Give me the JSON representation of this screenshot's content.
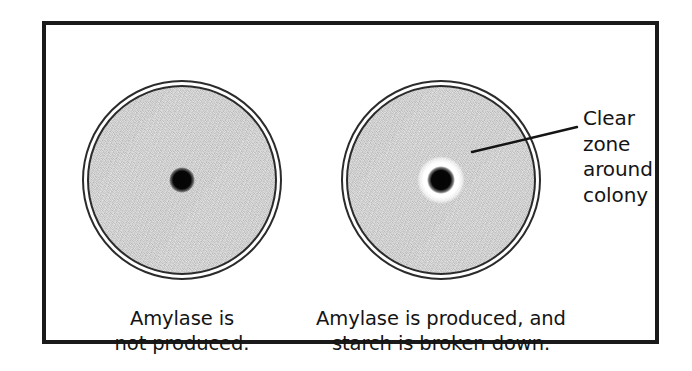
{
  "figure": {
    "frame_border_color": "#1a1a1a",
    "background_color": "#ffffff",
    "agar_color": "#c9c9c9",
    "colony_color": "#050505",
    "clear_zone_color": "#ffffff"
  },
  "plates": [
    {
      "id": "plate-no-amylase",
      "has_clear_zone": false,
      "caption_lines": [
        "Amylase is",
        "not produced."
      ]
    },
    {
      "id": "plate-amylase-positive",
      "has_clear_zone": true,
      "caption_lines": [
        "Amylase is produced, and",
        "starch is broken down."
      ]
    }
  ],
  "callout": {
    "lines": [
      "Clear",
      "zone",
      "around",
      "colony"
    ]
  }
}
